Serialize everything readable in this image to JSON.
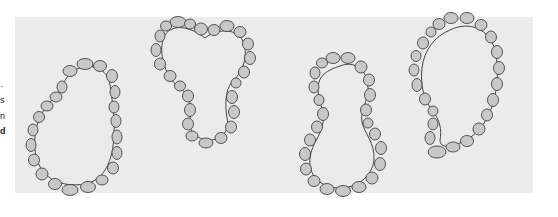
{
  "figure": {
    "left_margin_text_fragments": [
      "·",
      "s",
      "n",
      "d"
    ],
    "shapes": [
      {
        "name": "kidney-shaped-epithelial-ring"
      },
      {
        "name": "heart-shaped-epithelial-ring"
      },
      {
        "name": "figure-eight-epithelial-ring"
      },
      {
        "name": "comma-shaped-epithelial-ring"
      }
    ],
    "colors": {
      "background_panel": "#ececec",
      "cell_fill": "#c8c8c8",
      "outline": "#444444",
      "lumen": "#eaeaea"
    }
  }
}
